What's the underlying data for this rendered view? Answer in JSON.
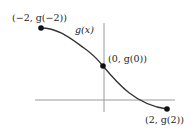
{
  "diagram": {
    "type": "function-graph",
    "function_label": "g(x)",
    "colors": {
      "axis": "#9a9a9a",
      "curve": "#333333",
      "point": "#111111",
      "text": "#222222"
    },
    "axes": {
      "x_axis": {
        "y": 100,
        "x_start": 35,
        "x_end": 175
      },
      "y_axis": {
        "x": 104,
        "y_start": 23,
        "y_end": 112
      }
    },
    "points": [
      {
        "id": "left",
        "label": "(−2, g(−2))",
        "math_x": -2,
        "math_y": "g(-2)",
        "px": 41,
        "py": 28
      },
      {
        "id": "center",
        "label": "(0, g(0))",
        "math_x": 0,
        "math_y": "g(0)",
        "px": 103,
        "py": 66
      },
      {
        "id": "right",
        "label": "(2, g(2))",
        "math_x": 2,
        "math_y": "g(2)",
        "px": 167,
        "py": 109
      }
    ]
  },
  "labels": {
    "left_point": "(−2, g(−2))",
    "center_point": "(0, g(0))",
    "right_point": "(2, g(2))",
    "curve": "g(x)"
  }
}
